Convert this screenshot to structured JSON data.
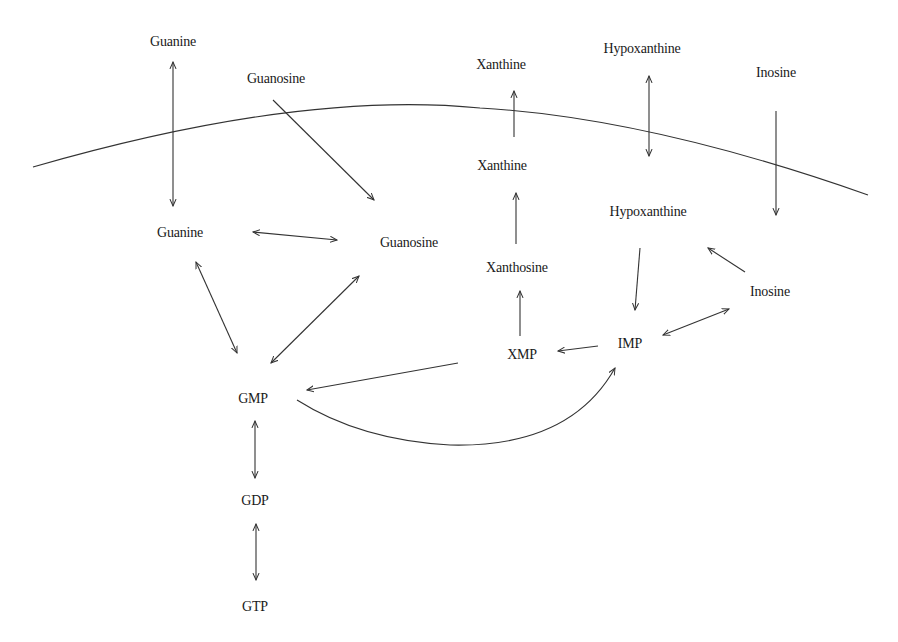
{
  "diagram": {
    "nodes": {
      "guanine_ext": "Guanine",
      "guanosine_ext": "Guanosine",
      "xanthine_ext": "Xanthine",
      "hypoxanthine_ext": "Hypoxanthine",
      "inosine_ext": "Inosine",
      "guanine_int": "Guanine",
      "guanosine_int": "Guanosine",
      "xanthine_int": "Xanthine",
      "xanthosine": "Xanthosine",
      "hypoxanthine_int": "Hypoxanthine",
      "inosine_int": "Inosine",
      "imp": "IMP",
      "xmp": "XMP",
      "gmp": "GMP",
      "gdp": "GDP",
      "gtp": "GTP"
    },
    "edges": [
      {
        "from": "Guanine (ext)",
        "to": "Guanine (int)",
        "type": "bidirectional"
      },
      {
        "from": "Guanosine (ext)",
        "to": "Guanosine (int)",
        "type": "forward"
      },
      {
        "from": "Xanthine (int)",
        "to": "Xanthine (ext)",
        "type": "forward"
      },
      {
        "from": "Hypoxanthine (ext)",
        "to": "Hypoxanthine (int)",
        "type": "bidirectional"
      },
      {
        "from": "Inosine (ext)",
        "to": "Inosine (int)",
        "type": "forward"
      },
      {
        "from": "Guanine (int)",
        "to": "Guanosine (int)",
        "type": "bidirectional"
      },
      {
        "from": "Guanine (int)",
        "to": "GMP",
        "type": "bidirectional"
      },
      {
        "from": "Guanosine (int)",
        "to": "GMP",
        "type": "bidirectional"
      },
      {
        "from": "Xanthosine",
        "to": "Xanthine (int)",
        "type": "forward"
      },
      {
        "from": "XMP",
        "to": "Xanthosine",
        "type": "forward"
      },
      {
        "from": "Hypoxanthine (int)",
        "to": "IMP",
        "type": "forward"
      },
      {
        "from": "Inosine (int)",
        "to": "Hypoxanthine (int)",
        "type": "forward"
      },
      {
        "from": "IMP",
        "to": "Inosine (int)",
        "type": "bidirectional"
      },
      {
        "from": "IMP",
        "to": "XMP",
        "type": "forward"
      },
      {
        "from": "XMP",
        "to": "GMP",
        "type": "forward"
      },
      {
        "from": "GMP",
        "to": "IMP",
        "type": "forward-curved"
      },
      {
        "from": "GMP",
        "to": "GDP",
        "type": "bidirectional"
      },
      {
        "from": "GDP",
        "to": "GTP",
        "type": "bidirectional"
      }
    ],
    "colors": {
      "line": "#333333",
      "text": "#1a1a1a",
      "background": "#ffffff"
    }
  }
}
